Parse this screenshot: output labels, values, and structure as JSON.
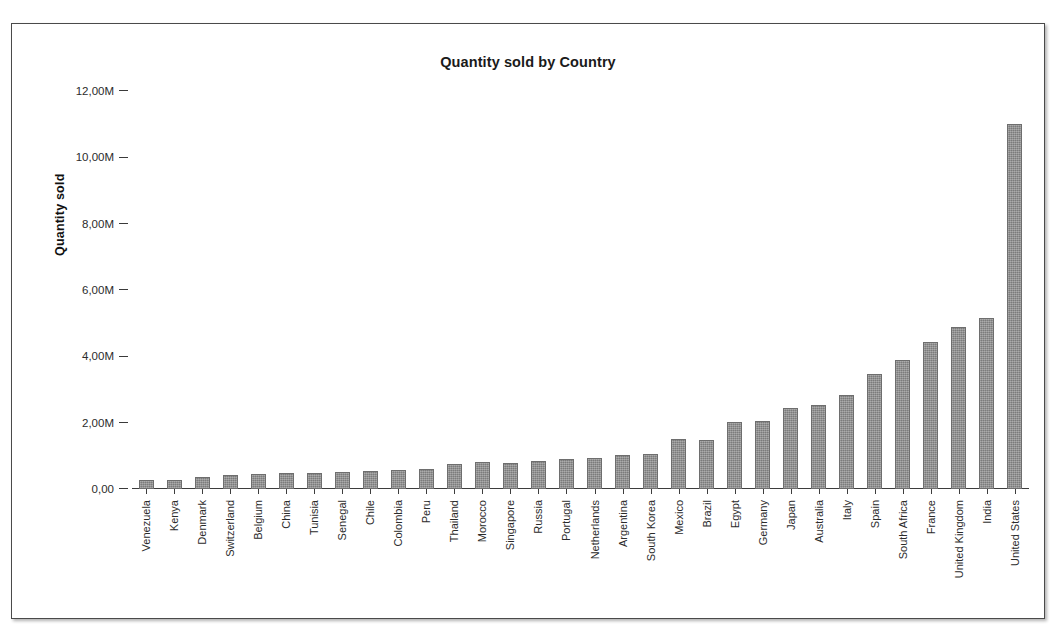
{
  "chart_data": {
    "type": "bar",
    "title": "Quantity sold by Country",
    "xlabel": "",
    "ylabel": "Quantity sold",
    "ylim": [
      0,
      12000000
    ],
    "grid": false,
    "legend": null,
    "ytick_labels": [
      "12,00M",
      "10,00M",
      "8,00M",
      "6,00M",
      "4,00M",
      "2,00M",
      "0,00"
    ],
    "ytick_values": [
      12000000,
      10000000,
      8000000,
      6000000,
      4000000,
      2000000,
      0
    ],
    "categories": [
      "Venezuela",
      "Kenya",
      "Denmark",
      "Switzerland",
      "Belgium",
      "China",
      "Tunisia",
      "Senegal",
      "Chile",
      "Colombia",
      "Peru",
      "Thailand",
      "Morocco",
      "Singapore",
      "Russia",
      "Portugal",
      "Netherlands",
      "Argentina",
      "South Korea",
      "Mexico",
      "Brazil",
      "Egypt",
      "Germany",
      "Japan",
      "Australia",
      "Italy",
      "Spain",
      "South Africa",
      "France",
      "United Kingdom",
      "India",
      "United States"
    ],
    "values": [
      270000,
      280000,
      360000,
      430000,
      450000,
      470000,
      490000,
      500000,
      530000,
      570000,
      600000,
      740000,
      800000,
      790000,
      830000,
      920000,
      950000,
      1030000,
      1070000,
      1500000,
      1480000,
      2020000,
      2060000,
      2440000,
      2520000,
      2820000,
      3480000,
      3880000,
      4420000,
      4880000,
      5150000,
      11020000
    ],
    "bar_color": "#898989",
    "bar_edge_color": "#6e6e6e",
    "axis_color": "#3d3d3d",
    "background_color": "#ffffff"
  }
}
